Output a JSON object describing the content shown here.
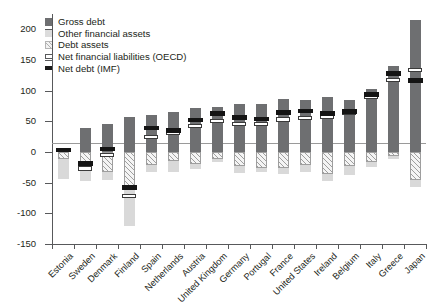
{
  "legend": {
    "items": [
      {
        "label": "Gross debt",
        "key": "gross-debt",
        "color": "#6e6f71"
      },
      {
        "label": "Other financial assets",
        "key": "other-financial-assets",
        "color": "#d9d9d9"
      },
      {
        "label": "Debt assets",
        "key": "debt-assets",
        "color": "#f4f4f4"
      },
      {
        "label": "Net financial liabilities (OECD)",
        "key": "net-financial-liabilities-oecd",
        "color": "#ffffff"
      },
      {
        "label": "Net debt (IMF)",
        "key": "net-debt-imf",
        "color": "#141414"
      }
    ]
  },
  "axis": {
    "y_ticks": [
      200,
      150,
      100,
      50,
      0,
      -50,
      -100,
      -150
    ],
    "y_tick_labels": [
      "200",
      "150",
      "100",
      "50",
      "0",
      "-50",
      "-100",
      "-150"
    ],
    "ylim": [
      -150,
      225
    ]
  },
  "chart_data": {
    "type": "bar",
    "title": "",
    "subtitle": "",
    "xlabel": "",
    "ylabel": "",
    "ylim": [
      -150,
      225
    ],
    "grid": false,
    "legend_position": "top-left",
    "categories": [
      "Estonia",
      "Sweden",
      "Denmark",
      "Finland",
      "Spain",
      "Netherlands",
      "Austria",
      "United Kingdom",
      "Germany",
      "Portugal",
      "France",
      "United States",
      "Ireland",
      "Belgium",
      "Italy",
      "Greece",
      "Japan"
    ],
    "series": [
      {
        "name": "Gross debt",
        "values": [
          7,
          39,
          46,
          57,
          61,
          66,
          72,
          74,
          78,
          79,
          86,
          85,
          89,
          85,
          102,
          141,
          216
        ]
      },
      {
        "name": "Debt assets",
        "values": [
          -11,
          -25,
          -33,
          -57,
          -22,
          -14,
          -19,
          -12,
          -23,
          -26,
          -26,
          -22,
          -36,
          -23,
          -16,
          -6,
          -45
        ]
      },
      {
        "name": "Other financial assets",
        "values": [
          -33,
          -22,
          -13,
          -63,
          -11,
          -19,
          -8,
          -5,
          -11,
          -7,
          -10,
          -11,
          -11,
          -14,
          -9,
          -5,
          -12
        ]
      },
      {
        "name": "Net financial liabilities (OECD)",
        "values": [
          null,
          -27,
          -5,
          -72,
          25,
          31,
          42,
          51,
          45,
          46,
          53,
          56,
          57,
          63,
          90,
          118,
          134
        ]
      },
      {
        "name": "Net debt (IMF)",
        "values": [
          3,
          -19,
          5,
          -58,
          39,
          35,
          52,
          63,
          56,
          54,
          64,
          67,
          63,
          66,
          94,
          128,
          117
        ]
      }
    ]
  }
}
